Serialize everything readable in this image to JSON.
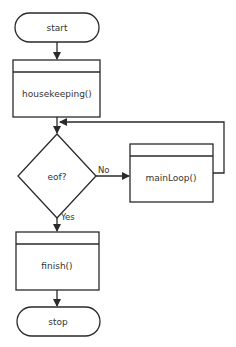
{
  "diagram": {
    "type": "flowchart",
    "nodes": {
      "start": {
        "label": "start",
        "shape": "terminal"
      },
      "housekeeping": {
        "label": "housekeeping()",
        "shape": "predefined-process"
      },
      "eof": {
        "label": "eof?",
        "shape": "decision"
      },
      "mainloop": {
        "label": "mainLoop()",
        "shape": "predefined-process"
      },
      "finish": {
        "label": "finish()",
        "shape": "predefined-process"
      },
      "stop": {
        "label": "stop",
        "shape": "terminal"
      }
    },
    "edges": {
      "no_label": "No",
      "yes_label": "Yes"
    },
    "colors": {
      "stroke": "#2a2a2a",
      "text": "#333333",
      "background": "#ffffff"
    }
  }
}
